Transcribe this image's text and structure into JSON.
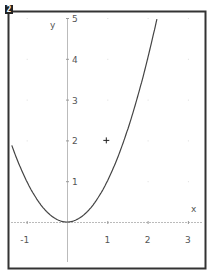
{
  "window": {
    "badge": "2"
  },
  "colors": {
    "frame": "#333333",
    "axis": "#bbbbbb",
    "curve": "#444444",
    "labels": "#555555",
    "grid_dot": "#dddddd"
  },
  "chart_data": {
    "type": "line",
    "title": "",
    "xlabel": "x",
    "ylabel": "y",
    "xlim": [
      -1.45,
      3.45
    ],
    "ylim": [
      -1.1,
      5.15
    ],
    "grid": "dots",
    "x_ticks": [
      -1,
      1,
      2,
      3
    ],
    "x_tick_labels": [
      "-1",
      "1",
      "2",
      "3"
    ],
    "y_ticks": [
      1,
      2,
      3,
      4,
      5
    ],
    "y_tick_labels": [
      "1",
      "2",
      "3",
      "4",
      "5"
    ],
    "series": [
      {
        "name": "y = x^2",
        "function": "x^2",
        "x": [
          -1.4,
          -1.0,
          -0.5,
          0,
          0.5,
          1.0,
          1.5,
          2.0,
          2.24
        ],
        "y": [
          1.96,
          1.0,
          0.25,
          0,
          0.25,
          1.0,
          2.25,
          4.0,
          5.0
        ]
      }
    ],
    "annotations": [
      {
        "type": "cross-marker",
        "x": 1,
        "y": 2
      }
    ]
  }
}
